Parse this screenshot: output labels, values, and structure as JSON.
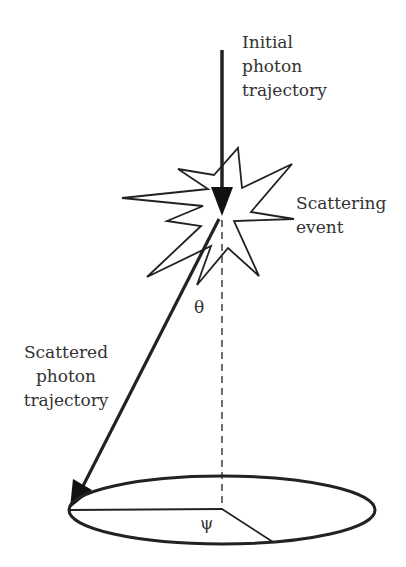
{
  "labels": {
    "initial": [
      "Initial",
      "photon",
      "trajectory"
    ],
    "scattering": [
      "Scattering",
      "event"
    ],
    "scattered": [
      "Scattered",
      "photon",
      "trajectory"
    ]
  },
  "symbols": {
    "theta": "θ",
    "psi": "ψ"
  },
  "colors": {
    "stroke": "#222222",
    "text": "#333333",
    "background": "#ffffff"
  }
}
